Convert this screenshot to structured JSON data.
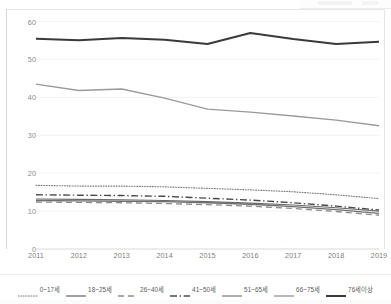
{
  "chart_data": {
    "type": "line",
    "title": "",
    "subtitle": "",
    "xlabel": "",
    "ylabel": "",
    "x": [
      2011,
      2012,
      2013,
      2014,
      2015,
      2016,
      2017,
      2018,
      2019
    ],
    "categories": [
      "2011",
      "2012",
      "2013",
      "2014",
      "2015",
      "2016",
      "2017",
      "2018",
      "2019"
    ],
    "ylim": [
      0,
      62
    ],
    "yticks": [
      0,
      10,
      20,
      30,
      40,
      50,
      60
    ],
    "ytick_labels": [
      "0",
      "10",
      "20",
      "30",
      "40",
      "50",
      "60"
    ],
    "grid": true,
    "grid_axis": "y",
    "legend_position": "bottom",
    "series": [
      {
        "name": "0~17세",
        "label": "0~17세",
        "color": "#7b7b7b",
        "style": "dotted",
        "width": 1.1,
        "values": [
          16.8,
          16.6,
          16.6,
          16.4,
          16.0,
          15.6,
          15.1,
          14.3,
          13.3
        ]
      },
      {
        "name": "18~25세",
        "label": "18~25세",
        "color": "#6e6e6e",
        "style": "solid",
        "width": 1.3,
        "values": [
          12.8,
          12.7,
          12.6,
          12.5,
          12.2,
          11.8,
          11.2,
          10.4,
          9.4
        ]
      },
      {
        "name": "26~40세",
        "label": "26~40세",
        "color": "#8c8c8c",
        "style": "dashed",
        "width": 1.3,
        "values": [
          12.4,
          12.3,
          12.2,
          12.0,
          11.7,
          11.3,
          10.7,
          9.9,
          8.9
        ]
      },
      {
        "name": "41~50세",
        "label": "41~50세",
        "color": "#4a4a4a",
        "style": "dashdot",
        "width": 1.4,
        "values": [
          14.3,
          14.2,
          14.1,
          13.9,
          13.4,
          12.9,
          12.2,
          11.3,
          10.3
        ]
      },
      {
        "name": "51~65세",
        "label": "51~65세",
        "color": "#6a6a6a",
        "style": "solid",
        "width": 1.1,
        "values": [
          13.2,
          13.1,
          13.0,
          12.8,
          12.5,
          12.1,
          11.6,
          10.9,
          10.0
        ]
      },
      {
        "name": "66~75세",
        "label": "66~75세",
        "color": "#9a9a9a",
        "style": "solid",
        "width": 1.4,
        "values": [
          43.5,
          41.8,
          42.2,
          39.8,
          36.9,
          36.1,
          35.1,
          34.0,
          32.5
        ]
      },
      {
        "name": "76세이상",
        "label": "76세이상",
        "color": "#3a3a3a",
        "style": "solid",
        "width": 2.0,
        "values": [
          55.5,
          55.1,
          55.7,
          55.2,
          54.1,
          57.0,
          55.4,
          54.1,
          54.7
        ]
      }
    ]
  },
  "axes": {
    "y_tick_labels": [
      "60",
      "50",
      "40",
      "30",
      "20",
      "10",
      "0"
    ],
    "x_tick_labels": [
      "2011",
      "2012",
      "2013",
      "2014",
      "2015",
      "2016",
      "2017",
      "2018",
      "2019"
    ]
  }
}
